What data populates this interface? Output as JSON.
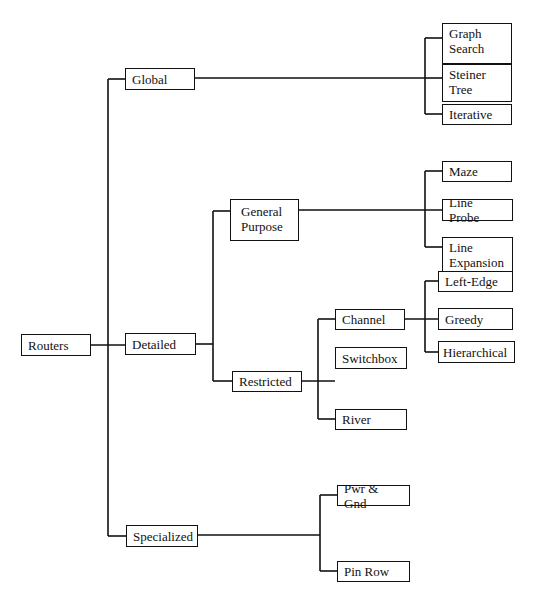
{
  "diagram": {
    "type": "tree",
    "root": "Routers",
    "nodes": {
      "routers": {
        "label": "Routers"
      },
      "global": {
        "label": "Global"
      },
      "detailed": {
        "label": "Detailed"
      },
      "specialized": {
        "label": "Specialized"
      },
      "graph_search": {
        "label": "Graph\nSearch"
      },
      "steiner_tree": {
        "label": "Steiner\nTree"
      },
      "iterative": {
        "label": "Iterative"
      },
      "general_purpose": {
        "label": "General\nPurpose"
      },
      "restricted": {
        "label": "Restricted"
      },
      "maze": {
        "label": "Maze"
      },
      "line_probe": {
        "label": "Line Probe"
      },
      "line_expansion": {
        "label": "Line\nExpansion"
      },
      "channel": {
        "label": "Channel"
      },
      "switchbox": {
        "label": "Switchbox"
      },
      "river": {
        "label": "River"
      },
      "left_edge": {
        "label": "Left-Edge"
      },
      "greedy": {
        "label": "Greedy"
      },
      "hierarchical": {
        "label": "Hierarchical"
      },
      "pwr_gnd": {
        "label": "Pwr & Gnd"
      },
      "pin_row": {
        "label": "Pin Row"
      }
    },
    "edges": [
      [
        "Routers",
        "Global"
      ],
      [
        "Routers",
        "Detailed"
      ],
      [
        "Routers",
        "Specialized"
      ],
      [
        "Global",
        "Graph Search"
      ],
      [
        "Global",
        "Steiner Tree"
      ],
      [
        "Global",
        "Iterative"
      ],
      [
        "Detailed",
        "General Purpose"
      ],
      [
        "Detailed",
        "Restricted"
      ],
      [
        "General Purpose",
        "Maze"
      ],
      [
        "General Purpose",
        "Line Probe"
      ],
      [
        "General Purpose",
        "Line Expansion"
      ],
      [
        "Restricted",
        "Channel"
      ],
      [
        "Restricted",
        "Switchbox"
      ],
      [
        "Restricted",
        "River"
      ],
      [
        "Channel",
        "Left-Edge"
      ],
      [
        "Channel",
        "Greedy"
      ],
      [
        "Channel",
        "Hierarchical"
      ],
      [
        "Specialized",
        "Pwr & Gnd"
      ],
      [
        "Specialized",
        "Pin Row"
      ]
    ]
  }
}
